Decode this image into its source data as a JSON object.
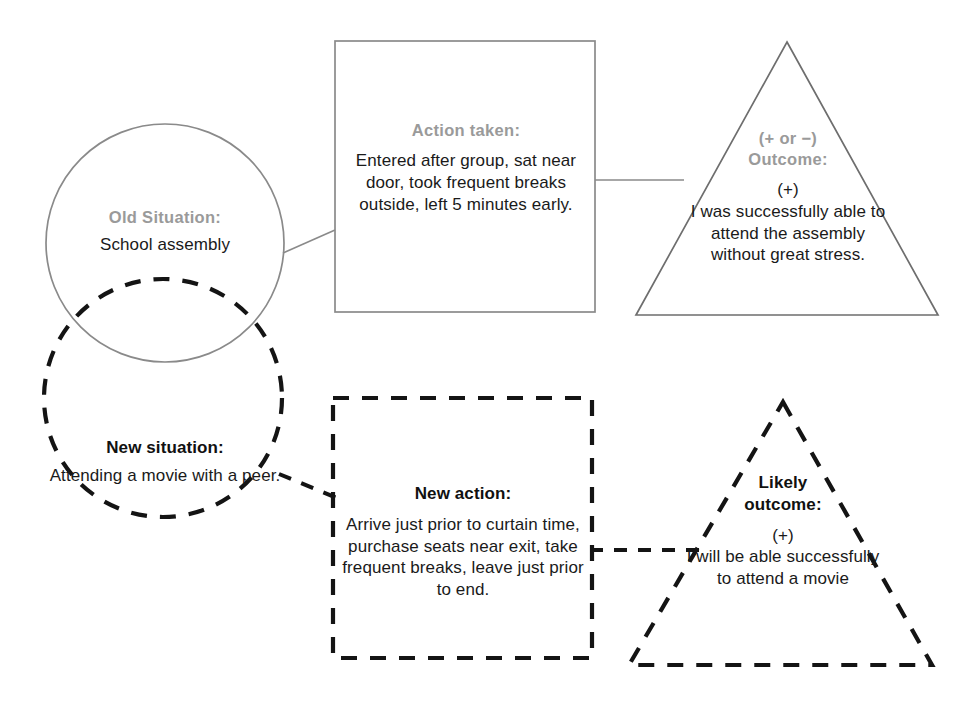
{
  "diagram": {
    "colors": {
      "old_stroke": "#8a8a8a",
      "new_stroke": "#141414",
      "label_gray": "#9a9a9a",
      "body_black": "#1a1a1a",
      "background": "#ffffff"
    },
    "old_situation": {
      "label": "Old Situation:",
      "value": "School assembly"
    },
    "action_taken": {
      "label": "Action taken:",
      "value": "Entered after group, sat near door, took frequent breaks outside, left 5 minutes early."
    },
    "outcome": {
      "label_line1": "(+ or −)",
      "label_line2": "Outcome:",
      "sign": "(+)",
      "value": "I was successfully able to attend the assembly without great stress."
    },
    "new_situation": {
      "label": "New situation:",
      "value": "Attending a movie with a peer."
    },
    "new_action": {
      "label": "New action:",
      "value": "Arrive just prior to curtain time, purchase seats near exit, take frequent breaks, leave just prior to end."
    },
    "likely_outcome": {
      "label_line1": "Likely",
      "label_line2": "outcome:",
      "sign": "(+)",
      "value": "I will be able successfully to attend a movie"
    }
  }
}
